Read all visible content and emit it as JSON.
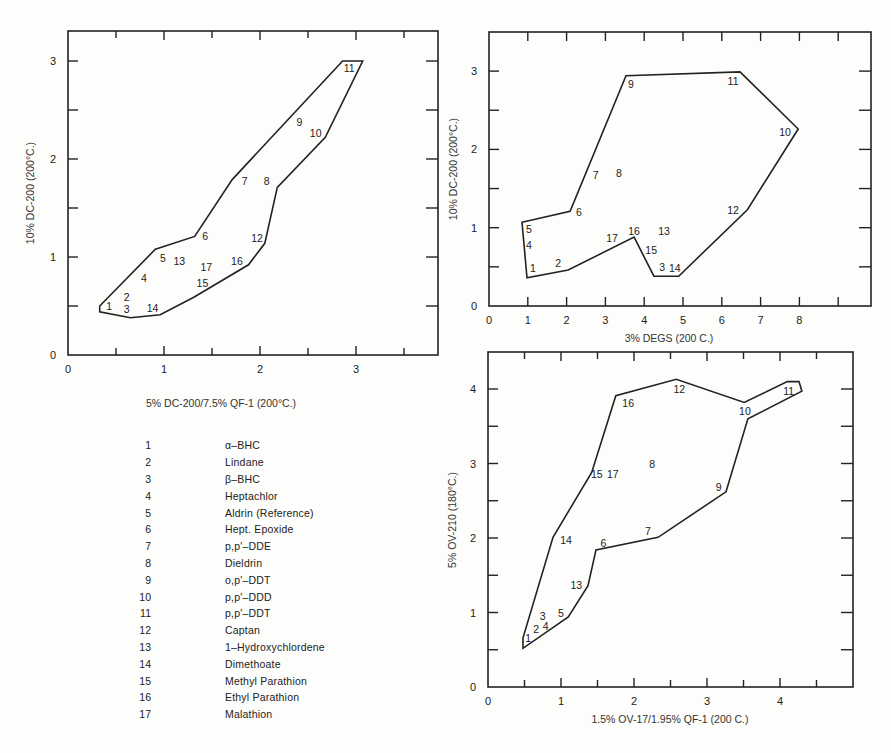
{
  "legend": {
    "items": [
      {
        "num": "1",
        "name": "α–BHC"
      },
      {
        "num": "2",
        "name": "Lindane"
      },
      {
        "num": "3",
        "name": "β–BHC"
      },
      {
        "num": "4",
        "name": "Heptachlor"
      },
      {
        "num": "5",
        "name": "Aldrin (Reference)"
      },
      {
        "num": "6",
        "name": "Hept. Epoxide"
      },
      {
        "num": "7",
        "name": "p,p'–DDE"
      },
      {
        "num": "8",
        "name": "Dieldrin"
      },
      {
        "num": "9",
        "name": "o,p'–DDT"
      },
      {
        "num": "10",
        "name": "p,p'–DDD"
      },
      {
        "num": "11",
        "name": "p,p'–DDT"
      },
      {
        "num": "12",
        "name": "Captan"
      },
      {
        "num": "13",
        "name": "1–Hydroxychlordene"
      },
      {
        "num": "14",
        "name": "Dimethoate"
      },
      {
        "num": "15",
        "name": "Methyl Parathion"
      },
      {
        "num": "16",
        "name": "Ethyl Parathion"
      },
      {
        "num": "17",
        "name": "Malathion"
      }
    ]
  },
  "chart_data": [
    {
      "type": "scatter",
      "title": "",
      "xlabel": "5% DC-200/7.5% QF-1 (200°C.)",
      "ylabel": "10% DC-200 (200°C.)",
      "xlim": [
        0,
        3.85
      ],
      "ylim": [
        0,
        3.3
      ],
      "x_ticks": [
        "0",
        "1",
        "2",
        "3"
      ],
      "y_ticks": [
        "0",
        "1",
        "2",
        "3"
      ],
      "grid": false,
      "legend_position": "below",
      "points": [
        {
          "label": "1",
          "x": 0.43,
          "y": 0.5
        },
        {
          "label": "2",
          "x": 0.61,
          "y": 0.59
        },
        {
          "label": "3",
          "x": 0.61,
          "y": 0.47
        },
        {
          "label": "4",
          "x": 0.79,
          "y": 0.79
        },
        {
          "label": "5",
          "x": 0.99,
          "y": 0.99
        },
        {
          "label": "6",
          "x": 1.43,
          "y": 1.21
        },
        {
          "label": "7",
          "x": 1.84,
          "y": 1.78
        },
        {
          "label": "8",
          "x": 2.07,
          "y": 1.78
        },
        {
          "label": "9",
          "x": 2.41,
          "y": 2.38
        },
        {
          "label": "10",
          "x": 2.58,
          "y": 2.27
        },
        {
          "label": "11",
          "x": 2.93,
          "y": 2.93
        },
        {
          "label": "12",
          "x": 1.97,
          "y": 1.19
        },
        {
          "label": "13",
          "x": 1.16,
          "y": 0.96
        },
        {
          "label": "14",
          "x": 0.88,
          "y": 0.48
        },
        {
          "label": "15",
          "x": 1.4,
          "y": 0.73
        },
        {
          "label": "16",
          "x": 1.76,
          "y": 0.96
        },
        {
          "label": "17",
          "x": 1.44,
          "y": 0.9
        }
      ],
      "envelope": [
        [
          0.33,
          0.5
        ],
        [
          0.33,
          0.44
        ],
        [
          0.65,
          0.38
        ],
        [
          0.96,
          0.41
        ],
        [
          1.31,
          0.59
        ],
        [
          1.88,
          0.92
        ],
        [
          2.05,
          1.14
        ],
        [
          2.18,
          1.71
        ],
        [
          2.68,
          2.22
        ],
        [
          3.07,
          3.0
        ],
        [
          2.86,
          3.0
        ],
        [
          1.71,
          1.79
        ],
        [
          1.32,
          1.21
        ],
        [
          0.91,
          1.08
        ]
      ]
    },
    {
      "type": "scatter",
      "title": "",
      "xlabel": "3% DEGS (200 C.)",
      "ylabel": "10% DC-200 (200°C.)",
      "xlim": [
        0,
        9.7
      ],
      "ylim": [
        0,
        3.5
      ],
      "x_ticks": [
        "0",
        "1",
        "2",
        "3",
        "4",
        "5",
        "6",
        "7",
        "8"
      ],
      "y_ticks": [
        "0",
        "1",
        "2",
        "3"
      ],
      "grid": false,
      "points": [
        {
          "label": "1",
          "x": 1.13,
          "y": 0.48
        },
        {
          "label": "2",
          "x": 1.78,
          "y": 0.55
        },
        {
          "label": "3",
          "x": 4.46,
          "y": 0.5
        },
        {
          "label": "4",
          "x": 1.03,
          "y": 0.78
        },
        {
          "label": "5",
          "x": 1.03,
          "y": 0.98
        },
        {
          "label": "6",
          "x": 2.32,
          "y": 1.2
        },
        {
          "label": "7",
          "x": 2.75,
          "y": 1.67
        },
        {
          "label": "8",
          "x": 3.35,
          "y": 1.7
        },
        {
          "label": "9",
          "x": 3.66,
          "y": 2.83
        },
        {
          "label": "10",
          "x": 7.63,
          "y": 2.22
        },
        {
          "label": "11",
          "x": 6.29,
          "y": 2.87
        },
        {
          "label": "12",
          "x": 6.29,
          "y": 1.23
        },
        {
          "label": "13",
          "x": 4.51,
          "y": 0.96
        },
        {
          "label": "14",
          "x": 4.79,
          "y": 0.49
        },
        {
          "label": "15",
          "x": 4.18,
          "y": 0.72
        },
        {
          "label": "16",
          "x": 3.74,
          "y": 0.96
        },
        {
          "label": "17",
          "x": 3.17,
          "y": 0.87
        }
      ],
      "envelope": [
        [
          0.85,
          1.07
        ],
        [
          2.09,
          1.21
        ],
        [
          3.53,
          2.94
        ],
        [
          6.47,
          2.99
        ],
        [
          7.97,
          2.26
        ],
        [
          6.66,
          1.23
        ],
        [
          4.89,
          0.38
        ],
        [
          4.25,
          0.38
        ],
        [
          3.74,
          0.88
        ],
        [
          2.04,
          0.46
        ],
        [
          0.98,
          0.36
        ]
      ]
    },
    {
      "type": "scatter",
      "title": "",
      "xlabel": "1.5% OV-17/1.95% QF-1 (200 C.)",
      "ylabel": "5% OV-210 (180°C.)",
      "xlim": [
        0,
        5.0
      ],
      "ylim": [
        0,
        4.5
      ],
      "x_ticks": [
        "0",
        "1",
        "2",
        "3",
        "4"
      ],
      "y_ticks": [
        "0",
        "1",
        "2",
        "3",
        "4"
      ],
      "grid": false,
      "points": [
        {
          "label": "1",
          "x": 0.55,
          "y": 0.66
        },
        {
          "label": "2",
          "x": 0.66,
          "y": 0.78
        },
        {
          "label": "3",
          "x": 0.75,
          "y": 0.95
        },
        {
          "label": "4",
          "x": 0.79,
          "y": 0.82
        },
        {
          "label": "5",
          "x": 1.0,
          "y": 0.99
        },
        {
          "label": "6",
          "x": 1.58,
          "y": 1.93
        },
        {
          "label": "7",
          "x": 2.19,
          "y": 2.09
        },
        {
          "label": "8",
          "x": 2.25,
          "y": 3.0
        },
        {
          "label": "9",
          "x": 3.16,
          "y": 2.68
        },
        {
          "label": "10",
          "x": 3.52,
          "y": 3.7
        },
        {
          "label": "11",
          "x": 4.12,
          "y": 3.97
        },
        {
          "label": "12",
          "x": 2.62,
          "y": 4.0
        },
        {
          "label": "13",
          "x": 1.21,
          "y": 1.37
        },
        {
          "label": "14",
          "x": 1.07,
          "y": 1.97
        },
        {
          "label": "15",
          "x": 1.49,
          "y": 2.86
        },
        {
          "label": "16",
          "x": 1.92,
          "y": 3.81
        },
        {
          "label": "17",
          "x": 1.71,
          "y": 2.86
        }
      ],
      "envelope": [
        [
          0.48,
          0.52
        ],
        [
          0.48,
          0.66
        ],
        [
          0.89,
          2.01
        ],
        [
          1.42,
          2.88
        ],
        [
          1.75,
          3.91
        ],
        [
          2.58,
          4.13
        ],
        [
          3.51,
          3.82
        ],
        [
          4.1,
          4.1
        ],
        [
          4.26,
          4.1
        ],
        [
          4.3,
          3.97
        ],
        [
          3.56,
          3.6
        ],
        [
          3.26,
          2.62
        ],
        [
          2.33,
          2.01
        ],
        [
          1.48,
          1.84
        ],
        [
          1.37,
          1.36
        ],
        [
          1.1,
          0.94
        ]
      ]
    }
  ]
}
